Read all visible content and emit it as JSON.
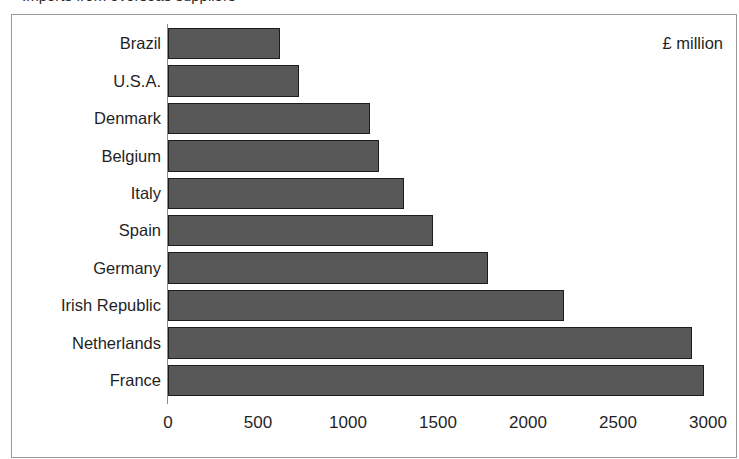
{
  "title_remnant": "Imports from overseas suppliers",
  "annotation": "£ million",
  "chart_data": {
    "type": "bar",
    "orientation": "horizontal",
    "title": "",
    "xlabel": "",
    "ylabel": "",
    "unit_annotation": "£ million",
    "categories": [
      "Brazil",
      "U.S.A.",
      "Denmark",
      "Belgium",
      "Italy",
      "Spain",
      "Germany",
      "Irish Republic",
      "Netherlands",
      "France"
    ],
    "values": [
      620,
      730,
      1120,
      1170,
      1310,
      1470,
      1780,
      2200,
      2910,
      2980
    ],
    "xlim": [
      0,
      3000
    ],
    "xticks": [
      0,
      500,
      1000,
      1500,
      2000,
      2500,
      3000
    ],
    "xtick_labels": [
      "0",
      "500",
      "1000",
      "1500",
      "2000",
      "2500",
      "3000"
    ],
    "grid": false,
    "legend": false,
    "bar_color": "#585858",
    "bar_border_color": "#1c1c1c",
    "frame_color": "#9a9a9a",
    "text_color": "#1f1f1f"
  }
}
